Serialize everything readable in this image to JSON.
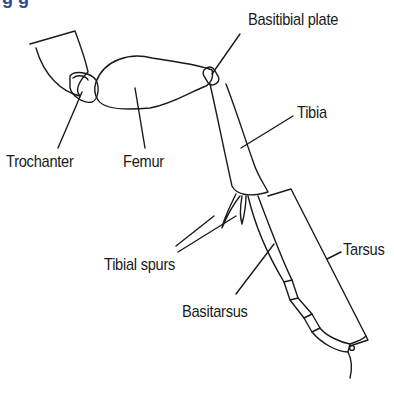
{
  "diagram": {
    "heading_partial": "g g",
    "heading_color": "#2a4a9a",
    "line_color": "#1a1a1a",
    "labels": {
      "basitibial_plate": "Basitibial plate",
      "tibia": "Tibia",
      "trochanter": "Trochanter",
      "femur": "Femur",
      "tibial_spurs": "Tibial spurs",
      "tarsus": "Tarsus",
      "basitarsus": "Basitarsus"
    }
  }
}
